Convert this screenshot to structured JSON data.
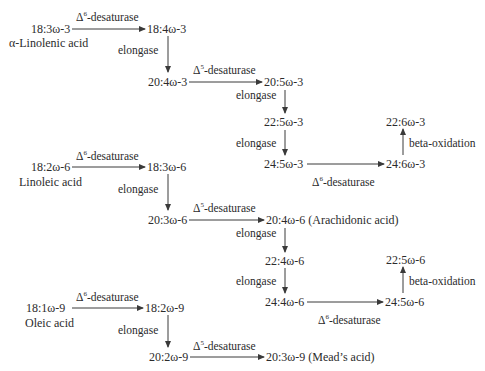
{
  "diagram": {
    "nodes": [
      {
        "id": "n1",
        "text": "18:3ω-3",
        "x": 31,
        "y": 22
      },
      {
        "id": "n2",
        "text": "α-Linolenic acid",
        "x": 9,
        "y": 36
      },
      {
        "id": "n3",
        "text": "18:4ω-3",
        "x": 147,
        "y": 22
      },
      {
        "id": "n4",
        "text": "20:4ω-3",
        "x": 148,
        "y": 75
      },
      {
        "id": "n5",
        "text": "20:5ω-3",
        "x": 264,
        "y": 75
      },
      {
        "id": "n6",
        "text": "22:5ω-3",
        "x": 264,
        "y": 115
      },
      {
        "id": "n7",
        "text": "24:5ω-3",
        "x": 264,
        "y": 157
      },
      {
        "id": "n8",
        "text": "24:6ω-3",
        "x": 386,
        "y": 157
      },
      {
        "id": "n9",
        "text": "22:6ω-3",
        "x": 386,
        "y": 115
      },
      {
        "id": "n10",
        "text": "18:2ω-6",
        "x": 31,
        "y": 160
      },
      {
        "id": "n11",
        "text": "Linoleic acid",
        "x": 19,
        "y": 175
      },
      {
        "id": "n12",
        "text": "18:3ω-6",
        "x": 147,
        "y": 160
      },
      {
        "id": "n13",
        "text": "20:3ω-6",
        "x": 148,
        "y": 213
      },
      {
        "id": "n14",
        "text": "20:4ω-6 (Arachidonic acid)",
        "x": 266,
        "y": 213
      },
      {
        "id": "n15",
        "text": "22:4ω-6",
        "x": 265,
        "y": 254
      },
      {
        "id": "n16",
        "text": "24:4ω-6",
        "x": 265,
        "y": 295
      },
      {
        "id": "n17",
        "text": "24:5ω-6",
        "x": 385,
        "y": 295
      },
      {
        "id": "n18",
        "text": "22:5ω-6",
        "x": 386,
        "y": 253
      },
      {
        "id": "n19",
        "text": "18:1ω-9",
        "x": 26,
        "y": 301
      },
      {
        "id": "n20",
        "text": "Oleic acid",
        "x": 25,
        "y": 316
      },
      {
        "id": "n21",
        "text": "18:2ω-9",
        "x": 145,
        "y": 301
      },
      {
        "id": "n22",
        "text": "20:2ω-9",
        "x": 149,
        "y": 350
      },
      {
        "id": "n23",
        "text": "20:3ω-9 (Mead’s acid)",
        "x": 266,
        "y": 350
      }
    ],
    "labels": [
      {
        "id": "l1",
        "base": "Δ",
        "sup": "6",
        "rest": "-desaturase",
        "x": 76,
        "y": 7
      },
      {
        "id": "l2",
        "text": "elongase",
        "x": 118,
        "y": 43
      },
      {
        "id": "l3",
        "base": "Δ",
        "sup": "5",
        "rest": "-desaturase",
        "x": 193,
        "y": 60
      },
      {
        "id": "l4",
        "text": "elongase",
        "x": 236,
        "y": 88
      },
      {
        "id": "l5",
        "text": "elongase",
        "x": 236,
        "y": 136
      },
      {
        "id": "l6",
        "base": "Δ",
        "sup": "6",
        "rest": "-desaturase",
        "x": 312,
        "y": 172
      },
      {
        "id": "l7",
        "text": "beta-oxidation",
        "x": 409,
        "y": 136
      },
      {
        "id": "l8",
        "base": "Δ",
        "sup": "6",
        "rest": "-desaturase",
        "x": 76,
        "y": 146
      },
      {
        "id": "l9",
        "text": "elongase",
        "x": 118,
        "y": 182
      },
      {
        "id": "l10",
        "base": "Δ",
        "sup": "5",
        "rest": "-desaturase",
        "x": 193,
        "y": 198
      },
      {
        "id": "l11",
        "text": "elongase",
        "x": 236,
        "y": 226
      },
      {
        "id": "l12",
        "text": "elongase",
        "x": 236,
        "y": 274
      },
      {
        "id": "l13",
        "base": "Δ",
        "sup": "6",
        "rest": "-desaturase",
        "x": 318,
        "y": 310
      },
      {
        "id": "l14",
        "text": "beta-oxidation",
        "x": 409,
        "y": 274
      },
      {
        "id": "l15",
        "base": "Δ",
        "sup": "6",
        "rest": "-desaturase",
        "x": 76,
        "y": 287
      },
      {
        "id": "l16",
        "text": "elongase",
        "x": 118,
        "y": 323
      },
      {
        "id": "l17",
        "base": "Δ",
        "sup": "5",
        "rest": "-desaturase",
        "x": 193,
        "y": 336
      }
    ],
    "colors": {
      "text": "#2b2b2b",
      "arrow": "#3a3a3a"
    }
  }
}
